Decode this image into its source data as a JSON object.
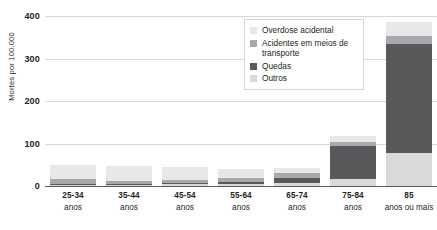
{
  "chart_data": {
    "type": "bar",
    "stacked": true,
    "title": "",
    "xlabel": "",
    "ylabel": "Mortes por 100.000",
    "ylim": [
      0,
      400
    ],
    "yticks": [
      0,
      100,
      200,
      300,
      400
    ],
    "grid": true,
    "legend_position": "top-right",
    "categories": [
      "25-34 anos",
      "35-44 anos",
      "45-54 anos",
      "55-64 anos",
      "65-74 anos",
      "75-84 anos",
      "85 anos ou mais"
    ],
    "category_lines": [
      {
        "range": "25-34",
        "unit": "anos"
      },
      {
        "range": "35-44",
        "unit": "anos"
      },
      {
        "range": "45-54",
        "unit": "anos"
      },
      {
        "range": "55-64",
        "unit": "anos"
      },
      {
        "range": "65-74",
        "unit": "anos"
      },
      {
        "range": "75-84",
        "unit": "anos"
      },
      {
        "range": "85",
        "unit": "anos ou mais"
      }
    ],
    "series": [
      {
        "name": "Outros",
        "color": "#d9d9d9",
        "values": [
          3,
          3,
          4,
          5,
          7,
          16,
          78
        ]
      },
      {
        "name": "Quedas",
        "color": "#58595b",
        "values": [
          1,
          1,
          2,
          5,
          12,
          78,
          255
        ]
      },
      {
        "name": "Acidentes em meios de transporte",
        "color": "#a7a9ac",
        "values": [
          12,
          9,
          9,
          9,
          11,
          10,
          20
        ]
      },
      {
        "name": "Overdose acidental",
        "color": "#e8e8e8",
        "values": [
          33,
          33,
          30,
          22,
          13,
          14,
          32
        ]
      }
    ],
    "totals": [
      49,
      46,
      45,
      41,
      43,
      118,
      385
    ]
  },
  "legend": {
    "items": [
      {
        "label": "Overdose acidental",
        "color": "#e8e8e8"
      },
      {
        "label": "Acidentes em meios de transporte",
        "color": "#a7a9ac"
      },
      {
        "label": "Quedas",
        "color": "#58595b"
      },
      {
        "label": "Outros",
        "color": "#d9d9d9"
      }
    ]
  },
  "axis": {
    "y_title": "Mortes por 100.000",
    "ticks": [
      "400",
      "300",
      "200",
      "100",
      "0"
    ]
  },
  "top_title_fragment": ""
}
